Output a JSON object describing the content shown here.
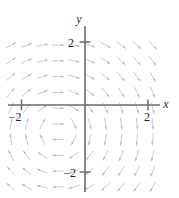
{
  "chart_data": {
    "type": "scatter",
    "title": "",
    "subtitle": "",
    "xlabel": "x",
    "ylabel": "y",
    "xlim": [
      -2.45,
      2.45
    ],
    "ylim": [
      -2.7,
      2.55
    ],
    "grid": false,
    "legend": null,
    "annotations": [],
    "x_ticks": [
      {
        "value": -2,
        "label": "−2"
      },
      {
        "value": 2,
        "label": "2"
      }
    ],
    "y_ticks": [
      {
        "value": 2,
        "label": "2"
      },
      {
        "value": -2,
        "label": "−2"
      }
    ],
    "field": {
      "grid_step": 0.5,
      "x_start": -2.35,
      "x_end": 2.35,
      "y_start": -2.6,
      "y_end": 2.35,
      "arrow_length_px": 11,
      "formula": "u = y + 0.85, v = -(x + 0.85)"
    }
  },
  "axes": {
    "x_axis_label": "x",
    "y_axis_label": "y",
    "x_tick_neg2": "−2",
    "x_tick_pos2": "2",
    "y_tick_pos2": "2",
    "y_tick_neg2": "−2"
  },
  "style": {
    "arrow_color": "#c8c8c8",
    "arrow_head_color": "#b9b9b9",
    "axis_color": "#6b6b6b",
    "label_color": "#1d1d1d",
    "background": "#ffffff"
  },
  "geometry": {
    "origin_x_px": 85,
    "origin_y_px": 105,
    "unit_x_px": 31.5,
    "unit_y_px": 31.5
  }
}
